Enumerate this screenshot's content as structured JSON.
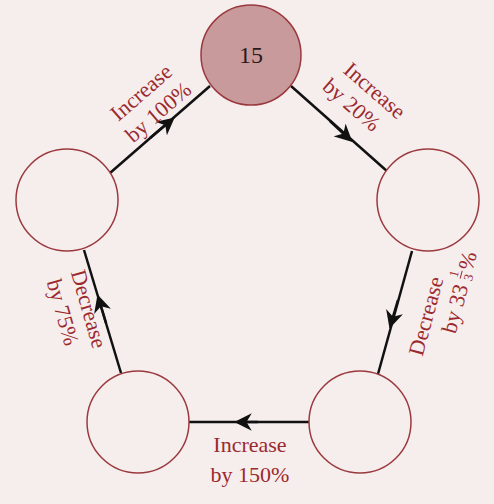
{
  "diagram": {
    "type": "cycle",
    "colors": {
      "background": "#f6eded",
      "start_fill": "#c99a9c",
      "node_stroke": "#9b3a3e",
      "node_fill": "#f6eded",
      "label": "#9b2a2e",
      "arrow": "#111111"
    },
    "nodes": [
      {
        "id": "top",
        "value": "15"
      },
      {
        "id": "right",
        "value": ""
      },
      {
        "id": "bottom-right",
        "value": ""
      },
      {
        "id": "bottom-left",
        "value": ""
      },
      {
        "id": "left",
        "value": ""
      }
    ],
    "edges": [
      {
        "from": "left",
        "to": "top",
        "line1": "Increase",
        "line2": "by 100%"
      },
      {
        "from": "top",
        "to": "right",
        "line1": "Increase",
        "line2": "by 20%"
      },
      {
        "from": "right",
        "to": "bottom-right",
        "line1": "Decrease",
        "line2_prefix": "by 33",
        "frac_num": "1",
        "frac_den": "3",
        "line2_suffix": "%"
      },
      {
        "from": "bottom-right",
        "to": "bottom-left",
        "line1": "Increase",
        "line2": "by 150%"
      },
      {
        "from": "bottom-left",
        "to": "left",
        "line1": "Decrease",
        "line2": "by 75%"
      }
    ]
  }
}
